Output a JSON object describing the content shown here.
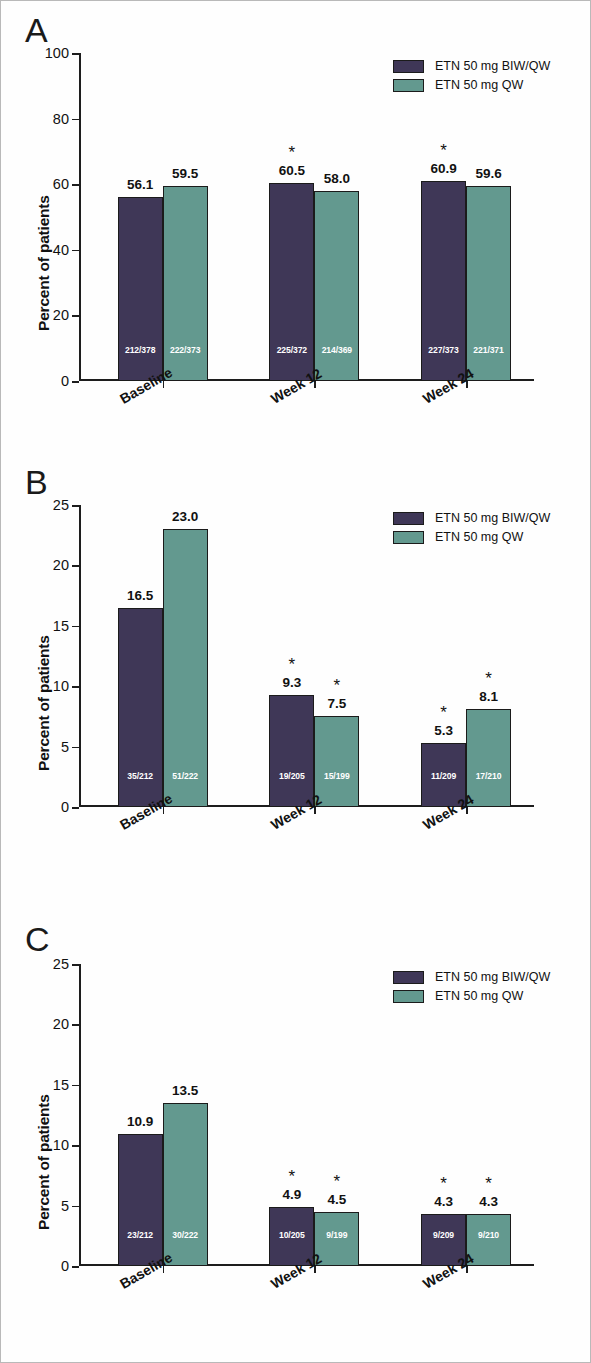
{
  "chart_data": [
    {
      "type": "bar",
      "panel": "A",
      "title": "",
      "xlabel": "",
      "ylabel": "Percent of patients",
      "categories": [
        "Baseline",
        "Week 12",
        "Week 24"
      ],
      "ylim": [
        0,
        100
      ],
      "yticks": [
        "0",
        "20",
        "40",
        "60",
        "80",
        "100"
      ],
      "grid": false,
      "legend_position": "top-right",
      "series": [
        {
          "name": "ETN 50 mg BIW/QW",
          "color": "#3f3757",
          "values": [
            56.1,
            60.5,
            60.9
          ],
          "value_labels": [
            "56.1",
            "60.5",
            "60.9"
          ],
          "fractions": [
            "212/378",
            "225/372",
            "227/373"
          ],
          "significance": [
            "",
            "*",
            "*"
          ]
        },
        {
          "name": "ETN 50 mg QW",
          "color": "#63998f",
          "values": [
            59.5,
            58.0,
            59.6
          ],
          "value_labels": [
            "59.5",
            "58.0",
            "59.6"
          ],
          "fractions": [
            "222/373",
            "214/369",
            "221/371"
          ],
          "significance": [
            "",
            "",
            ""
          ]
        }
      ]
    },
    {
      "type": "bar",
      "panel": "B",
      "title": "",
      "xlabel": "",
      "ylabel": "Percent of patients",
      "categories": [
        "Baseline",
        "Week 12",
        "Week 24"
      ],
      "ylim": [
        0,
        25
      ],
      "yticks": [
        "0",
        "5",
        "10",
        "15",
        "20",
        "25"
      ],
      "grid": false,
      "legend_position": "top-right",
      "series": [
        {
          "name": "ETN 50 mg BIW/QW",
          "color": "#3f3757",
          "values": [
            16.5,
            9.3,
            5.3
          ],
          "value_labels": [
            "16.5",
            "9.3",
            "5.3"
          ],
          "fractions": [
            "35/212",
            "19/205",
            "11/209"
          ],
          "significance": [
            "",
            "*",
            "*"
          ]
        },
        {
          "name": "ETN 50 mg QW",
          "color": "#63998f",
          "values": [
            23.0,
            7.5,
            8.1
          ],
          "value_labels": [
            "23.0",
            "7.5",
            "8.1"
          ],
          "fractions": [
            "51/222",
            "15/199",
            "17/210"
          ],
          "significance": [
            "",
            "*",
            "*"
          ]
        }
      ]
    },
    {
      "type": "bar",
      "panel": "C",
      "title": "",
      "xlabel": "",
      "ylabel": "Percent of patients",
      "categories": [
        "Baseline",
        "Week 12",
        "Week 24"
      ],
      "ylim": [
        0,
        25
      ],
      "yticks": [
        "0",
        "5",
        "10",
        "15",
        "20",
        "25"
      ],
      "grid": false,
      "legend_position": "top-right",
      "series": [
        {
          "name": "ETN 50 mg BIW/QW",
          "color": "#3f3757",
          "values": [
            10.9,
            4.9,
            4.3
          ],
          "value_labels": [
            "10.9",
            "4.9",
            "4.3"
          ],
          "fractions": [
            "23/212",
            "10/205",
            "9/209"
          ],
          "significance": [
            "",
            "*",
            "*"
          ]
        },
        {
          "name": "ETN 50 mg QW",
          "color": "#63998f",
          "values": [
            13.5,
            4.5,
            4.3
          ],
          "value_labels": [
            "13.5",
            "4.5",
            "4.3"
          ],
          "fractions": [
            "30/222",
            "9/199",
            "9/210"
          ],
          "significance": [
            "",
            "*",
            "*"
          ]
        }
      ]
    }
  ]
}
